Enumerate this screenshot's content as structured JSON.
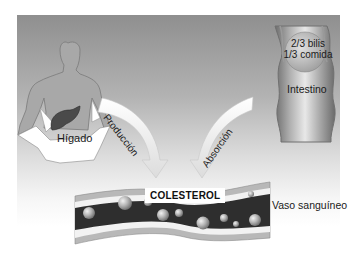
{
  "diagram": {
    "nodes": {
      "liver": {
        "label": "Hígado"
      },
      "intestine": {
        "label": "Intestino",
        "content_lines": [
          "2/3 bilis",
          "1/3 comida"
        ]
      },
      "cholesterol": {
        "label": "COLESTEROL"
      },
      "blood_vessel": {
        "label": "Vaso sanguíneo"
      }
    },
    "edges": [
      {
        "from": "liver",
        "to": "cholesterol",
        "label": "Producción"
      },
      {
        "from": "intestine",
        "to": "cholesterol",
        "label": "Absorción"
      }
    ],
    "colors": {
      "panel_top": "#8f8f8f",
      "panel_bottom": "#ffffff",
      "liver": "#4a4a4a",
      "vessel_lumen": "#2e2e2e",
      "vessel_wall": "#9a9a9a",
      "arrow": "#f2f2f2"
    }
  }
}
